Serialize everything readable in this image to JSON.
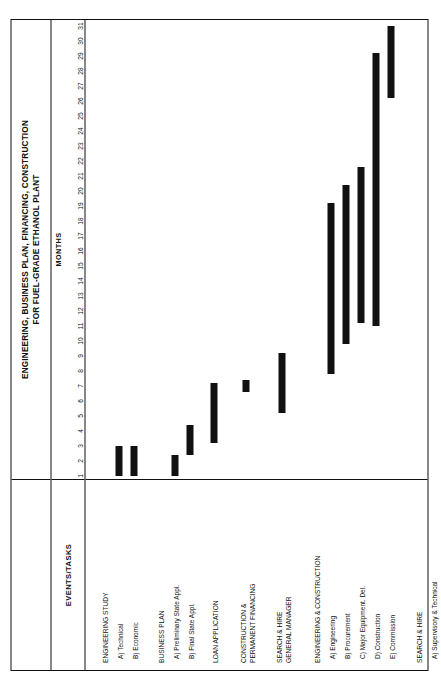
{
  "title": {
    "line1": "ENGINEERING, BUSINESS PLAN, FINANCING, CONSTRUCTION",
    "line2": "FOR FUEL-GRADE ETHANOL PLANT"
  },
  "header": {
    "tasks_label": "EVENTS/TASKS",
    "months_label": "MONTHS"
  },
  "chart_data": {
    "type": "bar",
    "title": "ENGINEERING, BUSINESS PLAN, FINANCING, CONSTRUCTION FOR FUEL-GRADE ETHANOL PLANT",
    "xlabel": "MONTHS",
    "ylabel": "EVENTS/TASKS",
    "xlim": [
      1,
      31
    ],
    "grid": false,
    "legend": null,
    "tick_labels": [
      "1",
      "2",
      "3",
      "4",
      "5",
      "6",
      "7",
      "8",
      "9",
      "10",
      "11",
      "12",
      "13",
      "14",
      "15",
      "16",
      "17",
      "18",
      "19",
      "20",
      "21",
      "22",
      "23",
      "24",
      "25",
      "26",
      "27",
      "28",
      "29",
      "30",
      "31"
    ],
    "categories": [
      "ENGINEERING STUDY",
      "A) Technical",
      "B) Economic",
      "BUSINESS PLAN",
      "A) Preliminary State Appl.",
      "B) Final State Appl.",
      "LOAN APPLICATION",
      "CONSTRUCTION & PERMANENT FINANCING",
      "SEARCH & HIRE GENERAL MANAGER",
      "ENGINEERING & CONSTRUCTION",
      "A) Engineering",
      "B) Procurement",
      "C) Major Equipment. Del.",
      "D) Construction",
      "E) Commission",
      "SEARCH & HIRE",
      "A) Supervisory & Technical",
      "B) Operating Foremen",
      "C) Process Labor, Office Personnel"
    ],
    "bars": [
      {
        "task": "A) Technical",
        "start": 1,
        "end": 3
      },
      {
        "task": "B) Economic",
        "start": 1,
        "end": 3
      },
      {
        "task": "A) Preliminary State Appl.",
        "start": 1,
        "end": 2.4
      },
      {
        "task": "B) Final State Appl.",
        "start": 2.4,
        "end": 4.4
      },
      {
        "task": "LOAN APPLICATION",
        "start": 3.2,
        "end": 7.2
      },
      {
        "task": "CONSTRUCTION & PERMANENT FINANCING",
        "start": 6.6,
        "end": 7.4
      },
      {
        "task": "SEARCH & HIRE GENERAL MANAGER",
        "start": 5.2,
        "end": 9.2
      },
      {
        "task": "A) Engineering",
        "start": 7.8,
        "end": 19.2
      },
      {
        "task": "B) Procurement",
        "start": 9.8,
        "end": 20.4
      },
      {
        "task": "C) Major Equipment. Del.",
        "start": 11.2,
        "end": 21.6
      },
      {
        "task": "D) Construction",
        "start": 11.0,
        "end": 29.2
      },
      {
        "task": "E) Commission",
        "start": 26.2,
        "end": 31.0
      },
      {
        "task": "A) Supervisory & Technical",
        "start": 13.0,
        "end": 22.8
      },
      {
        "task": "B) Operating Foremen",
        "start": 22.2,
        "end": 26.4
      },
      {
        "task": "C) Process Labor, Office Personnel",
        "start": 25.8,
        "end": 27.4
      }
    ]
  },
  "rows": [
    {
      "label": "ENGINEERING STUDY",
      "kind": "group",
      "top": 16
    },
    {
      "label": "A) Technical",
      "kind": "sub",
      "top": 31
    },
    {
      "label": "B) Economic",
      "kind": "sub",
      "top": 46
    },
    {
      "label": "BUSINESS PLAN",
      "kind": "group",
      "top": 72
    },
    {
      "label": "A) Preliminary State Appl.",
      "kind": "sub",
      "top": 87
    },
    {
      "label": "B) Final State Appl.",
      "kind": "sub",
      "top": 102
    },
    {
      "label": "LOAN APPLICATION",
      "kind": "group",
      "top": 126
    },
    {
      "label": "CONSTRUCTION &",
      "kind": "group",
      "top": 154
    },
    {
      "label": "PERMANENT FINANCING",
      "kind": "group",
      "top": 163
    },
    {
      "label": "SEARCH & HIRE",
      "kind": "group",
      "top": 190
    },
    {
      "label": "GENERAL MANAGER",
      "kind": "group",
      "top": 199
    },
    {
      "label": "ENGINEERING & CONSTRUCTION",
      "kind": "group",
      "top": 228
    },
    {
      "label": "A) Engineering",
      "kind": "sub",
      "top": 243
    },
    {
      "label": "B) Procurement",
      "kind": "sub",
      "top": 258
    },
    {
      "label": "C) Major Equipment. Del.",
      "kind": "sub",
      "top": 273
    },
    {
      "label": "D) Construction",
      "kind": "sub",
      "top": 288
    },
    {
      "label": "E) Commission",
      "kind": "sub",
      "top": 303
    },
    {
      "label": "SEARCH & HIRE",
      "kind": "group",
      "top": 330
    },
    {
      "label": "A) Supervisory & Technical",
      "kind": "sub",
      "top": 345
    },
    {
      "label": "B) Operating Foremen",
      "kind": "sub",
      "top": 360
    },
    {
      "label": "C) Process Labor,",
      "kind": "sub",
      "top": 375
    },
    {
      "label": "Office Personnel",
      "kind": "sub",
      "top": 384
    }
  ],
  "bar_rows": [
    {
      "name": "bar-technical",
      "top": 30,
      "start": 1,
      "end": 3
    },
    {
      "name": "bar-economic",
      "top": 45,
      "start": 1,
      "end": 3
    },
    {
      "name": "bar-preliminary-state-appl",
      "top": 86,
      "start": 1,
      "end": 2.4
    },
    {
      "name": "bar-final-state-appl",
      "top": 101,
      "start": 2.4,
      "end": 4.4
    },
    {
      "name": "bar-loan-application",
      "top": 125,
      "start": 3.2,
      "end": 7.2
    },
    {
      "name": "bar-construction-permanent-financing",
      "top": 157,
      "start": 6.6,
      "end": 7.4
    },
    {
      "name": "bar-search-hire-general-manager",
      "top": 193,
      "start": 5.2,
      "end": 9.2
    },
    {
      "name": "bar-engineering",
      "top": 242,
      "start": 7.8,
      "end": 19.2
    },
    {
      "name": "bar-procurement",
      "top": 257,
      "start": 9.8,
      "end": 20.4
    },
    {
      "name": "bar-major-equipment-del",
      "top": 272,
      "start": 11.2,
      "end": 21.6
    },
    {
      "name": "bar-construction",
      "top": 287,
      "start": 11.0,
      "end": 29.2
    },
    {
      "name": "bar-commission",
      "top": 302,
      "start": 26.2,
      "end": 31.0
    },
    {
      "name": "bar-supervisory-technical",
      "top": 344,
      "start": 13.0,
      "end": 22.8
    },
    {
      "name": "bar-operating-foremen",
      "top": 359,
      "start": 22.2,
      "end": 26.4
    },
    {
      "name": "bar-process-labor-office-personnel",
      "top": 378,
      "start": 25.8,
      "end": 27.4
    }
  ]
}
